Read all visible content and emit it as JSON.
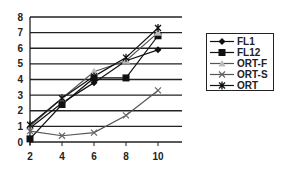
{
  "chart_data": {
    "type": "line",
    "title": "",
    "xlabel": "",
    "ylabel": "",
    "x": [
      2,
      4,
      6,
      8,
      10
    ],
    "ylim": [
      0,
      8
    ],
    "yticks": [
      0,
      1,
      2,
      3,
      4,
      5,
      6,
      7,
      8
    ],
    "xticks": [
      2,
      4,
      6,
      8,
      10
    ],
    "grid": "horizontal",
    "legend_position": "right",
    "series": [
      {
        "name": "FL1",
        "marker": "diamond",
        "values": [
          0.9,
          2.5,
          3.8,
          5.2,
          5.9
        ]
      },
      {
        "name": "FL12",
        "marker": "square",
        "values": [
          0.2,
          2.4,
          4.1,
          4.1,
          6.8
        ]
      },
      {
        "name": "ORT-F",
        "marker": "triangle",
        "values": [
          1.0,
          2.8,
          4.5,
          5.2,
          7.0
        ]
      },
      {
        "name": "ORT-S",
        "marker": "x",
        "values": [
          0.7,
          0.4,
          0.6,
          1.7,
          3.3
        ]
      },
      {
        "name": "ORT",
        "marker": "star",
        "values": [
          1.1,
          2.8,
          4.2,
          5.4,
          7.3
        ]
      }
    ]
  },
  "legend": {
    "items": [
      "FL1",
      "FL12",
      "ORT-F",
      "ORT-S",
      "ORT"
    ]
  }
}
